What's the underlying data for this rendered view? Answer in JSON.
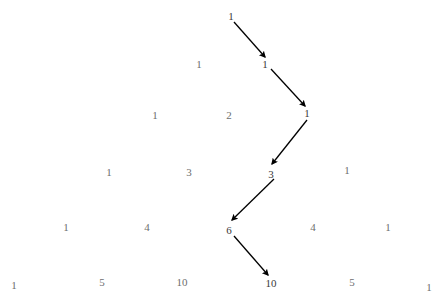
{
  "figure": {
    "background_color": "#ffffff",
    "number_color": "#6e6e6e",
    "path_number_color": "#3a3a3a",
    "arrow_color": "#000000",
    "width": 441,
    "height": 302
  },
  "chart_data": {
    "type": "diagram",
    "name": "pascals-triangle",
    "rows": [
      {
        "index": 0,
        "values": [
          1
        ]
      },
      {
        "index": 1,
        "values": [
          1,
          1
        ]
      },
      {
        "index": 2,
        "values": [
          1,
          2,
          1
        ]
      },
      {
        "index": 3,
        "values": [
          1,
          3,
          3,
          1
        ]
      },
      {
        "index": 4,
        "values": [
          1,
          4,
          6,
          4,
          1
        ]
      },
      {
        "index": 5,
        "values": [
          1,
          5,
          10,
          10,
          5,
          1
        ]
      }
    ],
    "path_values": [
      1,
      1,
      1,
      3,
      6,
      10
    ],
    "arrow_count": 5
  },
  "cells": [
    {
      "label": "1",
      "x": 231,
      "y": 16,
      "on_path": true
    },
    {
      "label": "1",
      "x": 199,
      "y": 64,
      "on_path": false
    },
    {
      "label": "1",
      "x": 265,
      "y": 64,
      "on_path": true
    },
    {
      "label": "1",
      "x": 155,
      "y": 115,
      "on_path": false
    },
    {
      "label": "2",
      "x": 229,
      "y": 115,
      "on_path": false
    },
    {
      "label": "1",
      "x": 307,
      "y": 113,
      "on_path": true
    },
    {
      "label": "1",
      "x": 109,
      "y": 172,
      "on_path": false
    },
    {
      "label": "3",
      "x": 189,
      "y": 172,
      "on_path": false
    },
    {
      "label": "3",
      "x": 271,
      "y": 174,
      "on_path": true
    },
    {
      "label": "1",
      "x": 347,
      "y": 170,
      "on_path": false
    },
    {
      "label": "1",
      "x": 66,
      "y": 227,
      "on_path": false
    },
    {
      "label": "4",
      "x": 147,
      "y": 227,
      "on_path": false
    },
    {
      "label": "6",
      "x": 229,
      "y": 230,
      "on_path": true
    },
    {
      "label": "4",
      "x": 313,
      "y": 227,
      "on_path": false
    },
    {
      "label": "1",
      "x": 388,
      "y": 227,
      "on_path": false
    },
    {
      "label": "1",
      "x": 14,
      "y": 285,
      "on_path": false
    },
    {
      "label": "5",
      "x": 102,
      "y": 282,
      "on_path": false
    },
    {
      "label": "10",
      "x": 182,
      "y": 282,
      "on_path": false
    },
    {
      "label": "10",
      "x": 271,
      "y": 283,
      "on_path": true
    },
    {
      "label": "5",
      "x": 352,
      "y": 282,
      "on_path": false
    },
    {
      "label": "1",
      "x": 429,
      "y": 287,
      "on_path": false
    }
  ],
  "arrows": [
    {
      "from": [
        234,
        22
      ],
      "to": [
        265,
        57
      ],
      "name": "arrow-1-to-1"
    },
    {
      "from": [
        271,
        69
      ],
      "to": [
        305,
        106
      ],
      "name": "arrow-1-to-1b"
    },
    {
      "from": [
        307,
        120
      ],
      "to": [
        272,
        164
      ],
      "name": "arrow-1-to-3"
    },
    {
      "from": [
        274,
        179
      ],
      "to": [
        232,
        220
      ],
      "name": "arrow-3-to-6"
    },
    {
      "from": [
        234,
        236
      ],
      "to": [
        268,
        275
      ],
      "name": "arrow-6-to-10"
    }
  ]
}
